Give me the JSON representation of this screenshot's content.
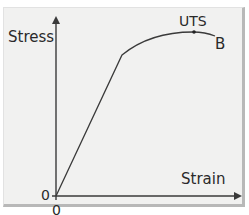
{
  "diagram": {
    "y_axis_label": "Stress",
    "x_axis_label": "Strain",
    "origin_y_label": "0",
    "origin_x_label": "0",
    "points": {
      "uts_label": "UTS",
      "break_label": "B"
    },
    "colors": {
      "background": "#f1f1f0",
      "line": "#3a3a3a",
      "border": "#b8b8b8"
    }
  }
}
